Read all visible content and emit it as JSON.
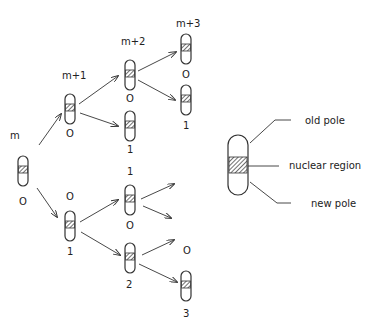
{
  "generations": [
    {
      "id": "gen-m",
      "label": "m"
    },
    {
      "id": "gen-m1",
      "label": "m+1"
    },
    {
      "id": "gen-m2",
      "label": "m+2"
    },
    {
      "id": "gen-m3",
      "label": "m+3"
    }
  ],
  "cells": [
    {
      "id": "c-m",
      "x": 18,
      "y": 156,
      "w": 10,
      "h": 30,
      "age_label": "O",
      "age_pos": [
        23,
        205
      ]
    },
    {
      "id": "c-m1-top",
      "x": 65,
      "y": 94,
      "w": 10,
      "h": 30,
      "age_label": "O",
      "age_pos": [
        70,
        137
      ]
    },
    {
      "id": "c-m2-a",
      "x": 125,
      "y": 60,
      "w": 10,
      "h": 30,
      "age_label": "O",
      "age_pos": [
        130,
        102
      ]
    },
    {
      "id": "c-m2-b",
      "x": 125,
      "y": 111,
      "w": 10,
      "h": 30,
      "age_label": "1",
      "age_pos": [
        130,
        153
      ]
    },
    {
      "id": "c-m3-a",
      "x": 181,
      "y": 34,
      "w": 10,
      "h": 30,
      "age_label": "O",
      "age_pos": [
        186,
        78
      ]
    },
    {
      "id": "c-m3-b",
      "x": 181,
      "y": 85,
      "w": 10,
      "h": 30,
      "age_label": "1",
      "age_pos": [
        186,
        129
      ]
    },
    {
      "id": "c-m1-bot",
      "x": 65,
      "y": 211,
      "w": 10,
      "h": 30,
      "top_label": "O",
      "top_pos": [
        70,
        200
      ],
      "age_label": "1",
      "age_pos": [
        70,
        255
      ]
    },
    {
      "id": "c-m2-c",
      "x": 125,
      "y": 185,
      "w": 10,
      "h": 30,
      "top_label": "1",
      "top_pos": [
        130,
        175
      ],
      "age_label": "O",
      "age_pos": [
        130,
        229
      ]
    },
    {
      "id": "c-m2-d",
      "x": 125,
      "y": 243,
      "w": 10,
      "h": 30,
      "age_label": "2",
      "age_pos": [
        130,
        288
      ]
    },
    {
      "id": "c-m3-d",
      "x": 181,
      "y": 271,
      "w": 10,
      "h": 30,
      "top_label": "O",
      "top_pos": [
        187,
        254
      ],
      "age_label": "3",
      "age_pos": [
        187,
        317
      ]
    }
  ],
  "labels": {
    "m": "m",
    "m1": "m+1",
    "m2": "m+2",
    "m3": "m+3",
    "c_m_age": "O",
    "c_m1_top_age": "O",
    "c_m2_a_age": "O",
    "c_m2_b_age": "1",
    "c_m3_a_age": "O",
    "c_m3_b_age": "1",
    "c_m1_bot_top": "O",
    "c_m1_bot_age": "1",
    "c_m2_c_top": "1",
    "c_m2_c_age": "O",
    "c_m2_d_age": "2",
    "c_m3_d_top": "O",
    "c_m3_d_age": "3"
  },
  "legend": {
    "old_pole": "old pole",
    "nuclear_region": "nuclear region",
    "new_pole": "new pole"
  }
}
